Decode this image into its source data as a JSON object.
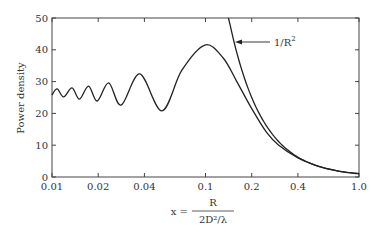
{
  "chart_data": {
    "type": "line",
    "title": "",
    "xlabel": {
      "prefix": "x =",
      "numerator": "R",
      "denominator": "2D²/λ"
    },
    "ylabel": "Power density",
    "xscale": "log",
    "xlim": [
      0.01,
      1.0
    ],
    "ylim": [
      0,
      50
    ],
    "grid": false,
    "xticks": [
      {
        "value": 0.01,
        "label": "0.01"
      },
      {
        "value": 0.02,
        "label": "0.02"
      },
      {
        "value": 0.04,
        "label": "0.04"
      },
      {
        "value": 0.1,
        "label": "0.1"
      },
      {
        "value": 0.2,
        "label": "0.2"
      },
      {
        "value": 0.4,
        "label": "0.4"
      },
      {
        "value": 1.0,
        "label": "1.0"
      }
    ],
    "yticks": [
      {
        "value": 0,
        "label": "0"
      },
      {
        "value": 10,
        "label": "10"
      },
      {
        "value": 20,
        "label": "20"
      },
      {
        "value": 30,
        "label": "30"
      },
      {
        "value": 40,
        "label": "40"
      },
      {
        "value": 50,
        "label": "50"
      }
    ],
    "series": [
      {
        "name": "Power density",
        "points": [
          [
            0.01,
            25.8
          ],
          [
            0.0108,
            27.7
          ],
          [
            0.0119,
            25.2
          ],
          [
            0.0135,
            28.0
          ],
          [
            0.0151,
            24.5
          ],
          [
            0.0173,
            28.6
          ],
          [
            0.0197,
            23.9
          ],
          [
            0.0234,
            29.6
          ],
          [
            0.0282,
            22.6
          ],
          [
            0.0373,
            32.4
          ],
          [
            0.052,
            20.8
          ],
          [
            0.07,
            33.5
          ],
          [
            0.099,
            41.5
          ],
          [
            0.13,
            37.5
          ],
          [
            0.16,
            30.0
          ],
          [
            0.2,
            21.5
          ],
          [
            0.25,
            14.0
          ],
          [
            0.3,
            10.0
          ],
          [
            0.4,
            6.0
          ],
          [
            0.5,
            4.0
          ],
          [
            0.6,
            2.8
          ],
          [
            0.7,
            2.1
          ],
          [
            0.8,
            1.6
          ],
          [
            0.9,
            1.3
          ],
          [
            1.0,
            1.1
          ]
        ]
      },
      {
        "name": "1/R²",
        "formula": "1/x^2",
        "x_range": [
          0.141,
          1.0
        ]
      }
    ],
    "annotations": [
      {
        "text": "1/R",
        "superscript": "2",
        "points_to": "1/R² curve"
      }
    ]
  }
}
